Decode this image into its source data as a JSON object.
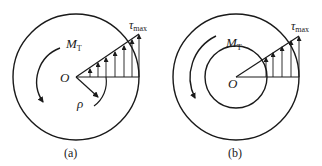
{
  "figure": {
    "panels": [
      {
        "id": "a",
        "caption": "(a)",
        "section": "solid circular shaft",
        "center_label": "O",
        "torque_label_main": "M",
        "torque_label_sub": "T",
        "stress_label_main": "τ",
        "stress_label_sub": "max",
        "radius_label": "ρ"
      },
      {
        "id": "b",
        "caption": "(b)",
        "section": "hollow circular shaft",
        "center_label": "O",
        "torque_label_main": "M",
        "torque_label_sub": "T",
        "stress_label_main": "τ",
        "stress_label_sub": "max"
      }
    ],
    "colors": {
      "stroke": "#1a1a1a",
      "background": "#ffffff"
    }
  }
}
